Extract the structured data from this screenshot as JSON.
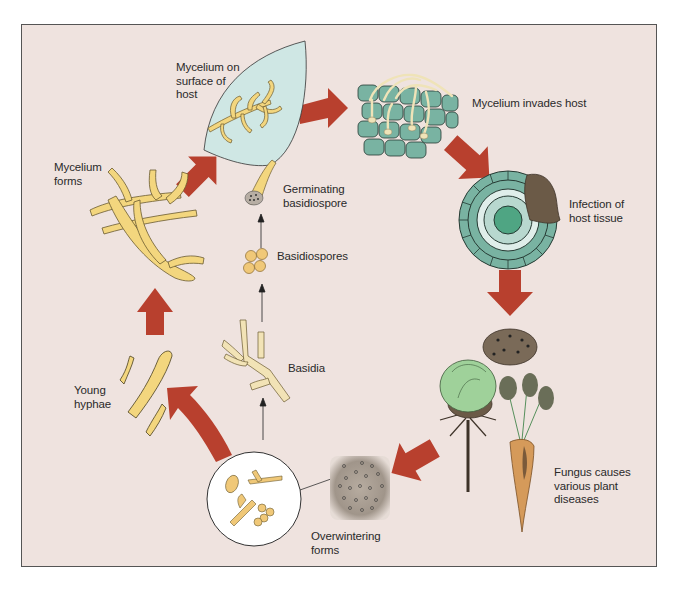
{
  "diagram": {
    "type": "life-cycle",
    "colors": {
      "background": "#efe3df",
      "frame_border": "#555555",
      "arrow": "#b8402e",
      "hyphae": "#f3d67e",
      "host_leaf": "#cfe7e4",
      "host_cells": "#79b3a2",
      "infected_tissue": "#6b5a47",
      "spores": "#f0c878"
    },
    "stages": [
      {
        "id": "mycelium-on-host",
        "label": "Mycelium on\nsurface of\nhost"
      },
      {
        "id": "mycelium-invades",
        "label": "Mycelium invades host"
      },
      {
        "id": "infection",
        "label": "Infection of\nhost tissue"
      },
      {
        "id": "plant-diseases",
        "label": "Fungus causes\nvarious plant\ndiseases"
      },
      {
        "id": "overwintering",
        "label": "Overwintering\nforms"
      },
      {
        "id": "young-hyphae",
        "label": "Young\nhyphae"
      },
      {
        "id": "mycelium-forms",
        "label": "Mycelium\nforms"
      },
      {
        "id": "basidia",
        "label": "Basidia"
      },
      {
        "id": "basidiospores",
        "label": "Basidiospores"
      },
      {
        "id": "germinating",
        "label": "Germinating\nbasidiospore"
      }
    ],
    "flow": [
      "Mycelium forms -> Mycelium on surface of host",
      "Mycelium on surface of host -> Mycelium invades host",
      "Mycelium invades host -> Infection of host tissue",
      "Infection of host tissue -> Fungus causes various plant diseases",
      "Fungus causes various plant diseases -> Overwintering forms",
      "Overwintering forms -> Young hyphae",
      "Young hyphae -> Mycelium forms",
      "Overwintering forms -> Basidia",
      "Basidia -> Basidiospores",
      "Basidiospores -> Germinating basidiospore"
    ]
  }
}
